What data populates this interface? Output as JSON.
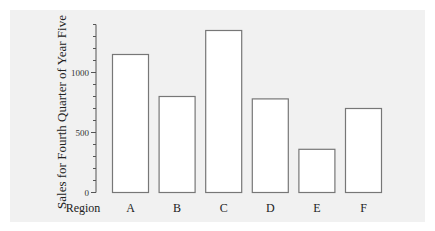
{
  "chart_data": {
    "type": "bar",
    "title": "",
    "xlabel": "Region",
    "ylabel": "Sales for Fourth Quarter of Year Five",
    "categories": [
      "A",
      "B",
      "C",
      "D",
      "E",
      "F"
    ],
    "values": [
      1150,
      800,
      1350,
      780,
      360,
      700
    ],
    "ylim": [
      0,
      1400
    ],
    "yticks_labeled": [
      0,
      500,
      1000
    ],
    "ytick_minor_step": 100,
    "grid": false,
    "legend": null,
    "bar_fill": "#ffffff",
    "bar_stroke": "#777777",
    "background": "#f1f1f1"
  }
}
